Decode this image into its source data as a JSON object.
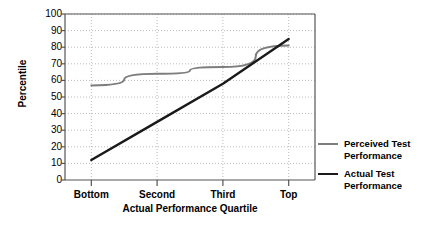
{
  "chart_data": {
    "type": "line",
    "title": "",
    "xlabel": "Actual Performance Quartile",
    "ylabel": "Percentile",
    "categories": [
      "Bottom",
      "Second",
      "Third",
      "Top"
    ],
    "ylim": [
      0,
      100
    ],
    "ytick_step": 10,
    "yticks": [
      "100",
      "90",
      "80",
      "70",
      "60",
      "50",
      "40",
      "30",
      "20",
      "10",
      "0"
    ],
    "grid": "dotted-both-axes",
    "legend_position": "right",
    "series": [
      {
        "name": "Perceived Test\nPerformance",
        "legend_label": "Perceived Test Performance",
        "color": "#7d7d7d",
        "values": [
          57,
          64,
          68,
          81
        ]
      },
      {
        "name": "Actual Test\nPerformance",
        "legend_label": "Actual Test Performance",
        "color": "#1a1a1a",
        "values": [
          12,
          35,
          58,
          85
        ]
      }
    ]
  },
  "axis": {
    "y_title": "Percentile",
    "x_title": "Actual Performance Quartile"
  },
  "legend": {
    "items": [
      {
        "label": "Perceived Test\nPerformance",
        "color": "#7d7d7d"
      },
      {
        "label": "Actual Test\nPerformance",
        "color": "#1a1a1a"
      }
    ]
  },
  "colors": {
    "background": "#ffffff",
    "axis": "#555555",
    "grid": "#bbbbbb",
    "perceived": "#7d7d7d",
    "actual": "#1a1a1a"
  }
}
